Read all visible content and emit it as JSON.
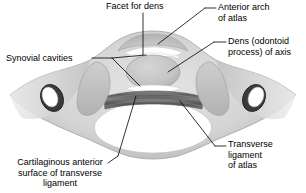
{
  "figure": {
    "type": "anatomical-illustration",
    "background_color": "#ffffff",
    "ink_color": "#000000",
    "bone_fill": "#d9d9d9",
    "bone_shadow": "#b0b0b0",
    "ligament_color": "#6e6e6e",
    "cavity_color": "#ffffff"
  },
  "labels": {
    "facet_for_dens": "Facet for dens",
    "anterior_arch": "Anterior arch\nof atlas",
    "dens": "Dens (odontoid\nprocess) of axis",
    "synovial_cavities": "Synovial cavities",
    "transverse_ligament_of_atlas": "Transverse\nligament\nof atlas",
    "cartilaginous_surface": "Cartilaginous anterior\nsurface of transverse\nligament"
  },
  "structures": [
    {
      "name": "anterior-arch-of-atlas"
    },
    {
      "name": "dens-of-axis"
    },
    {
      "name": "facet-for-dens"
    },
    {
      "name": "synovial-cavity-superior"
    },
    {
      "name": "synovial-cavity-inferior"
    },
    {
      "name": "transverse-ligament"
    },
    {
      "name": "lateral-mass-left"
    },
    {
      "name": "lateral-mass-right"
    },
    {
      "name": "transverse-foramen-left"
    },
    {
      "name": "transverse-foramen-right"
    },
    {
      "name": "vertebral-foramen"
    },
    {
      "name": "posterior-arch"
    }
  ]
}
